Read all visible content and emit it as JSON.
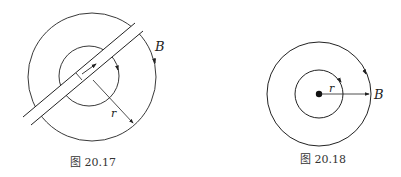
{
  "figures": [
    {
      "caption": "图 20.17",
      "labels": {
        "field": "B",
        "radius": "r"
      }
    },
    {
      "caption": "图 20.18",
      "labels": {
        "field": "B",
        "radius": "r"
      }
    }
  ],
  "colors": {
    "stroke": "#222222",
    "background": "#ffffff"
  }
}
